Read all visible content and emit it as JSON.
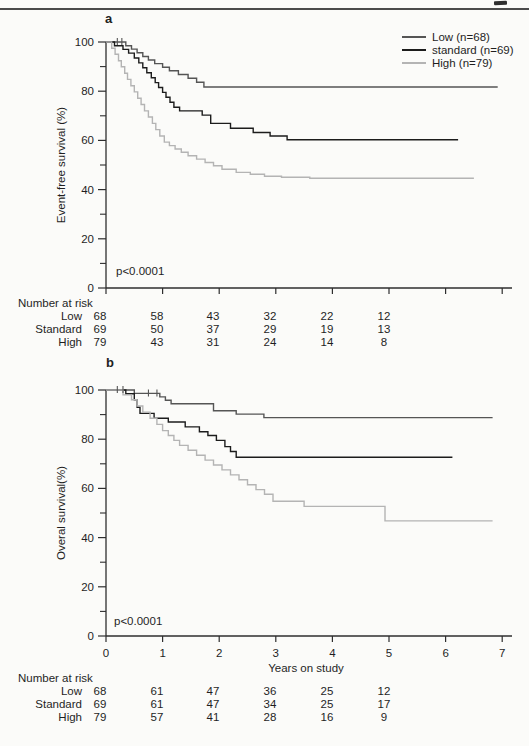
{
  "figure": {
    "panel_a": {
      "label": "a",
      "ylabel": "Event-free survival (%)",
      "p_value": "p<0.0001",
      "y_tick_labels": [
        "100",
        "80",
        "60",
        "40",
        "20",
        "0"
      ],
      "legend": [
        {
          "label": "Low (n=68)",
          "color": "#555555"
        },
        {
          "label": "standard (n=69)",
          "color": "#1c1c1c"
        },
        {
          "label": "High (n=79)",
          "color": "#b4b4b4"
        }
      ],
      "risk_table": {
        "title": "Number at risk",
        "rows": [
          {
            "label": "Low",
            "values": [
              "68",
              "58",
              "43",
              "32",
              "22",
              "12"
            ]
          },
          {
            "label": "Standard",
            "values": [
              "69",
              "50",
              "37",
              "29",
              "19",
              "13"
            ]
          },
          {
            "label": "High",
            "values": [
              "79",
              "43",
              "31",
              "24",
              "14",
              "8"
            ]
          }
        ]
      }
    },
    "panel_b": {
      "label": "b",
      "ylabel": "Overal survival(%)",
      "xlabel": "Years on study",
      "p_value": "p<0.0001",
      "y_tick_labels": [
        "100",
        "80",
        "60",
        "40",
        "20",
        "0"
      ],
      "x_tick_labels": [
        "0",
        "1",
        "2",
        "3",
        "4",
        "5",
        "6",
        "7"
      ],
      "risk_table": {
        "title": "Number at risk",
        "rows": [
          {
            "label": "Low",
            "values": [
              "68",
              "61",
              "47",
              "36",
              "25",
              "12"
            ]
          },
          {
            "label": "Standard",
            "values": [
              "69",
              "61",
              "47",
              "34",
              "25",
              "17"
            ]
          },
          {
            "label": "High",
            "values": [
              "79",
              "57",
              "41",
              "28",
              "16",
              "9"
            ]
          }
        ]
      }
    }
  },
  "chart_data": [
    {
      "type": "line",
      "subtype": "kaplan-meier-step",
      "panel": "a",
      "title": "",
      "xlabel": "",
      "ylabel": "Event-free survival (%)",
      "xlim": [
        0,
        7
      ],
      "ylim": [
        0,
        100
      ],
      "x_ticks": [
        0,
        1,
        2,
        3,
        4,
        5,
        6,
        7
      ],
      "x_tick_labels_shown": false,
      "y_ticks_major": [
        0,
        20,
        40,
        60,
        80,
        100
      ],
      "y_ticks_minor": [
        10,
        30,
        50,
        70,
        90
      ],
      "grid": false,
      "legend_position": "top-right",
      "annotation": "p<0.0001",
      "number_at_risk": {
        "times": [
          0,
          1,
          2,
          3,
          4,
          5
        ],
        "Low": [
          68,
          58,
          43,
          32,
          22,
          12
        ],
        "Standard": [
          69,
          50,
          37,
          29,
          19,
          13
        ],
        "High": [
          79,
          43,
          31,
          24,
          14,
          8
        ]
      },
      "series": [
        {
          "name": "Low (n=68)",
          "n": 68,
          "color": "#555555",
          "t_end": 6.92,
          "points": [
            [
              0,
              100
            ],
            [
              0.35,
              98.5
            ],
            [
              0.45,
              97.1
            ],
            [
              0.55,
              95.6
            ],
            [
              0.65,
              94.1
            ],
            [
              0.75,
              92.7
            ],
            [
              0.86,
              91.2
            ],
            [
              1.0,
              89.7
            ],
            [
              1.12,
              88.3
            ],
            [
              1.28,
              86.8
            ],
            [
              1.45,
              85.3
            ],
            [
              1.6,
              83.6
            ],
            [
              1.73,
              81.7
            ]
          ],
          "censors": [
            [
              0.2,
              100
            ],
            [
              0.28,
              100
            ]
          ]
        },
        {
          "name": "standard (n=69)",
          "n": 69,
          "color": "#1c1c1c",
          "t_end": 6.22,
          "points": [
            [
              0,
              100
            ],
            [
              0.15,
              98.5
            ],
            [
              0.3,
              97
            ],
            [
              0.4,
              95.5
            ],
            [
              0.5,
              93.5
            ],
            [
              0.58,
              91.5
            ],
            [
              0.65,
              89.5
            ],
            [
              0.72,
              87.5
            ],
            [
              0.8,
              85.5
            ],
            [
              0.87,
              83.5
            ],
            [
              0.93,
              81.5
            ],
            [
              1.0,
              79.5
            ],
            [
              1.06,
              77.5
            ],
            [
              1.13,
              75.5
            ],
            [
              1.2,
              73.5
            ],
            [
              1.3,
              72
            ],
            [
              1.7,
              70.3
            ],
            [
              1.85,
              66.9
            ],
            [
              2.2,
              64.9
            ],
            [
              2.6,
              63.2
            ],
            [
              2.9,
              61.8
            ],
            [
              3.2,
              60.3
            ]
          ],
          "censors": []
        },
        {
          "name": "High (n=79)",
          "n": 79,
          "color": "#b4b4b4",
          "t_end": 6.5,
          "points": [
            [
              0,
              100
            ],
            [
              0.1,
              97.5
            ],
            [
              0.16,
              95
            ],
            [
              0.22,
              92.4
            ],
            [
              0.27,
              89.9
            ],
            [
              0.33,
              87.3
            ],
            [
              0.38,
              84.8
            ],
            [
              0.44,
              82.2
            ],
            [
              0.5,
              79.7
            ],
            [
              0.56,
              77.1
            ],
            [
              0.62,
              74.6
            ],
            [
              0.68,
              72
            ],
            [
              0.75,
              69.5
            ],
            [
              0.82,
              66.9
            ],
            [
              0.88,
              64.4
            ],
            [
              0.95,
              61.8
            ],
            [
              1.03,
              59.3
            ],
            [
              1.12,
              57.9
            ],
            [
              1.22,
              56.5
            ],
            [
              1.33,
              55.2
            ],
            [
              1.45,
              53.8
            ],
            [
              1.6,
              52.4
            ],
            [
              1.75,
              51
            ],
            [
              1.9,
              49.7
            ],
            [
              2.05,
              48.3
            ],
            [
              2.3,
              47
            ],
            [
              2.55,
              46.2
            ],
            [
              2.8,
              45.4
            ],
            [
              3.1,
              45
            ],
            [
              3.6,
              44.6
            ]
          ],
          "censors": []
        }
      ]
    },
    {
      "type": "line",
      "subtype": "kaplan-meier-step",
      "panel": "b",
      "title": "",
      "xlabel": "Years on study",
      "ylabel": "Overal survival(%)",
      "xlim": [
        0,
        7
      ],
      "ylim": [
        0,
        100
      ],
      "x_ticks": [
        0,
        1,
        2,
        3,
        4,
        5,
        6,
        7
      ],
      "x_tick_labels_shown": true,
      "y_ticks_major": [
        0,
        20,
        40,
        60,
        80,
        100
      ],
      "y_ticks_minor": [
        10,
        30,
        50,
        70,
        90
      ],
      "grid": false,
      "legend_position": "none",
      "annotation": "p<0.0001",
      "number_at_risk": {
        "times": [
          0,
          1,
          2,
          3,
          4,
          5
        ],
        "Low": [
          68,
          61,
          47,
          36,
          25,
          12
        ],
        "Standard": [
          69,
          61,
          47,
          34,
          25,
          17
        ],
        "High": [
          79,
          57,
          41,
          28,
          16,
          9
        ]
      },
      "series": [
        {
          "name": "Low (n=68)",
          "n": 68,
          "color": "#555555",
          "t_end": 6.83,
          "points": [
            [
              0,
              100
            ],
            [
              0.5,
              98.6
            ],
            [
              0.95,
              97.2
            ],
            [
              1.05,
              95.8
            ],
            [
              1.15,
              94.4
            ],
            [
              1.9,
              91.6
            ],
            [
              2.3,
              90.2
            ],
            [
              2.79,
              88.8
            ]
          ],
          "censors": [
            [
              0.2,
              100
            ],
            [
              0.3,
              100
            ],
            [
              0.75,
              98.6
            ],
            [
              0.9,
              98.6
            ]
          ]
        },
        {
          "name": "standard (n=69)",
          "n": 69,
          "color": "#1c1c1c",
          "t_end": 6.12,
          "points": [
            [
              0,
              100
            ],
            [
              0.35,
              98.5
            ],
            [
              0.5,
              96
            ],
            [
              0.55,
              93
            ],
            [
              0.6,
              90.5
            ],
            [
              0.85,
              88.5
            ],
            [
              1.1,
              87
            ],
            [
              1.4,
              85
            ],
            [
              1.65,
              83
            ],
            [
              1.8,
              81.5
            ],
            [
              1.95,
              79.5
            ],
            [
              2.1,
              77
            ],
            [
              2.2,
              75
            ],
            [
              2.3,
              72.7
            ]
          ],
          "censors": []
        },
        {
          "name": "High (n=79)",
          "n": 79,
          "color": "#b4b4b4",
          "t_end": 6.83,
          "points": [
            [
              0,
              100
            ],
            [
              0.3,
              98
            ],
            [
              0.45,
              96
            ],
            [
              0.55,
              93.5
            ],
            [
              0.65,
              91
            ],
            [
              0.78,
              88.5
            ],
            [
              0.9,
              86
            ],
            [
              1.0,
              83.5
            ],
            [
              1.1,
              81.5
            ],
            [
              1.2,
              79.5
            ],
            [
              1.3,
              77.5
            ],
            [
              1.45,
              75.5
            ],
            [
              1.6,
              73.5
            ],
            [
              1.75,
              71.5
            ],
            [
              1.9,
              69.5
            ],
            [
              2.05,
              67.5
            ],
            [
              2.2,
              65.5
            ],
            [
              2.35,
              63.5
            ],
            [
              2.5,
              61.5
            ],
            [
              2.65,
              59.5
            ],
            [
              2.8,
              57.6
            ],
            [
              2.95,
              54.8
            ],
            [
              3.5,
              52.7
            ],
            [
              4.93,
              46.8
            ]
          ],
          "censors": []
        }
      ]
    }
  ]
}
